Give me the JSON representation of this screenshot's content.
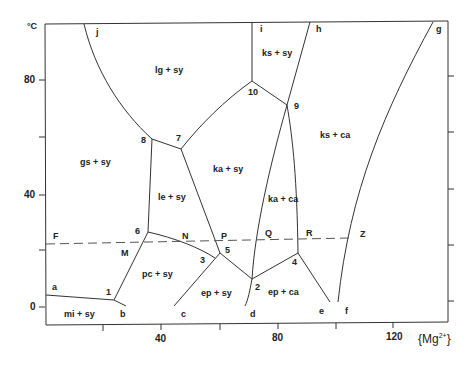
{
  "diagram": {
    "title": "",
    "y_axis": {
      "unit": "°C",
      "ticks": [
        "0",
        "40",
        "80"
      ]
    },
    "x_axis": {
      "unit": "{Mg2+}",
      "ticks": [
        "40",
        "80",
        "120"
      ]
    },
    "regions": [
      "lg + sy",
      "ks + sy",
      "ks + ca",
      "gs + sy",
      "ka + sy",
      "le + sy",
      "ka + ca",
      "pc + sy",
      "ep + sy",
      "ep + ca",
      "mi + sy"
    ],
    "invariant_points": [
      "1",
      "2",
      "3",
      "4",
      "5",
      "6",
      "7",
      "8",
      "9",
      "10"
    ],
    "boundary_endpoints": [
      "a",
      "b",
      "c",
      "d",
      "e",
      "f",
      "g",
      "h",
      "i",
      "j"
    ],
    "isotherm_points": [
      "F",
      "M",
      "N",
      "P",
      "Q",
      "R",
      "Z"
    ],
    "labels": {
      "yunit": "°C",
      "y0": "0",
      "y40": "40",
      "y80": "80",
      "x40": "40",
      "x80": "80",
      "x120": "120",
      "xunit_main": "Mg",
      "xunit_sup": "2+",
      "r_lg_sy": "lg + sy",
      "r_ks_sy": "ks + sy",
      "r_ks_ca": "ks + ca",
      "r_gs_sy": "gs + sy",
      "r_ka_sy": "ka + sy",
      "r_le_sy": "le + sy",
      "r_ka_ca": "ka + ca",
      "r_pc_sy": "pc + sy",
      "r_ep_sy": "ep + sy",
      "r_ep_ca": "ep + ca",
      "r_mi_sy": "mi + sy",
      "p1": "1",
      "p2": "2",
      "p3": "3",
      "p4": "4",
      "p5": "5",
      "p6": "6",
      "p7": "7",
      "p8": "8",
      "p9": "9",
      "p10": "10",
      "a": "a",
      "b": "b",
      "c": "c",
      "d": "d",
      "e": "e",
      "f": "f",
      "g": "g",
      "h": "h",
      "i": "i",
      "j": "j",
      "F": "F",
      "M": "M",
      "N": "N",
      "P": "P",
      "Q": "Q",
      "R": "R",
      "Z": "Z"
    }
  }
}
